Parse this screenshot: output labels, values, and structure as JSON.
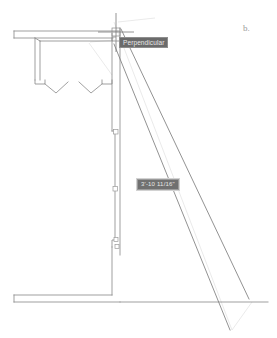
{
  "figure": {
    "label": "b."
  },
  "tooltips": {
    "osnap": {
      "name": "Perpendicular",
      "label": "Perpendicular"
    },
    "dimension": {
      "name": "dimension-input",
      "label": "3'-10 11/16\""
    }
  },
  "drawing": {
    "title": "architectural-floor-plan",
    "type": "cad-plan-view",
    "elements": [
      {
        "name": "top-exterior-wall",
        "kind": "wall-double-line"
      },
      {
        "name": "left-interior-wall",
        "kind": "wall-double-line"
      },
      {
        "name": "door-opening-left",
        "kind": "door-swing"
      },
      {
        "name": "door-opening-right",
        "kind": "door-swing"
      },
      {
        "name": "vertical-wall-selected",
        "kind": "wall-double-line"
      },
      {
        "name": "bottom-exterior-wall",
        "kind": "wall-double-line"
      },
      {
        "name": "angled-wall",
        "kind": "wall-double-line"
      },
      {
        "name": "tracking-line-upper",
        "kind": "construction-line"
      },
      {
        "name": "tracking-line-lower",
        "kind": "construction-line"
      },
      {
        "name": "crosshair-cursor",
        "kind": "cursor"
      }
    ],
    "grips": [
      {
        "name": "grip-top",
        "x": 116,
        "y": 132
      },
      {
        "name": "grip-middle",
        "x": 116,
        "y": 189
      },
      {
        "name": "grip-bottom",
        "x": 117,
        "y": 240
      },
      {
        "name": "grip-lower",
        "x": 118,
        "y": 246
      }
    ]
  },
  "colors": {
    "background": "#ffffff",
    "geometry": "#8c8c8c",
    "geometry_dark": "#6e6e6e",
    "construction": "#d8d8d8",
    "tooltip_bg": "#6b6b6b",
    "tooltip_text": "#e8e8e8",
    "grip": "#9a9a9a"
  }
}
